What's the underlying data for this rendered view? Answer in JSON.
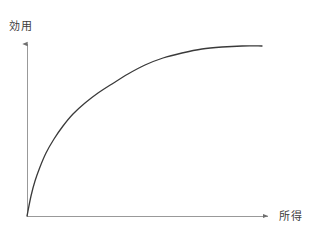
{
  "figure": {
    "background_color": "#ffffff",
    "width": 315,
    "height": 240
  },
  "labels": {
    "y_axis": "効用",
    "x_axis": "所得"
  },
  "style": {
    "axis_color": "#999999",
    "curve_color": "#3a3a3a",
    "label_color": "#3c3c3c",
    "axis_width": 1,
    "curve_width": 1.3
  },
  "chart_data": {
    "type": "line",
    "title": "",
    "subtitle": "",
    "xlabel": "所得",
    "ylabel": "効用",
    "grid": false,
    "legend": null,
    "annotations": [],
    "xlim": [
      0,
      1
    ],
    "ylim": [
      0,
      1
    ],
    "x_tick_labels": [],
    "y_tick_labels": [],
    "axis_arrows": {
      "x": "right",
      "y": "up"
    },
    "series": [
      {
        "name": "utility",
        "x": [
          0.0,
          0.02,
          0.05,
          0.09,
          0.14,
          0.2,
          0.27,
          0.34,
          0.42,
          0.5,
          0.57,
          0.64,
          0.72,
          0.8,
          0.88,
          0.94,
          1.0
        ],
        "y": [
          0.0,
          0.17,
          0.27,
          0.37,
          0.46,
          0.55,
          0.63,
          0.7,
          0.76,
          0.81,
          0.85,
          0.88,
          0.91,
          0.93,
          0.95,
          0.955,
          0.96
        ]
      }
    ],
    "pixel_geometry": {
      "origin": [
        27,
        216
      ],
      "x_axis_end": [
        272,
        216
      ],
      "y_axis_top": [
        27,
        40
      ],
      "curve_end": [
        262,
        46
      ],
      "curve_points": [
        [
          27,
          216
        ],
        [
          31,
          196
        ],
        [
          35,
          181
        ],
        [
          40,
          167
        ],
        [
          46,
          153
        ],
        [
          54,
          139
        ],
        [
          63,
          126
        ],
        [
          73,
          114
        ],
        [
          85,
          103
        ],
        [
          98,
          93
        ],
        [
          112,
          84
        ],
        [
          128,
          74
        ],
        [
          145,
          65
        ],
        [
          163,
          58
        ],
        [
          182,
          53
        ],
        [
          202,
          49
        ],
        [
          222,
          47
        ],
        [
          242,
          46
        ],
        [
          262,
          46
        ]
      ]
    }
  }
}
